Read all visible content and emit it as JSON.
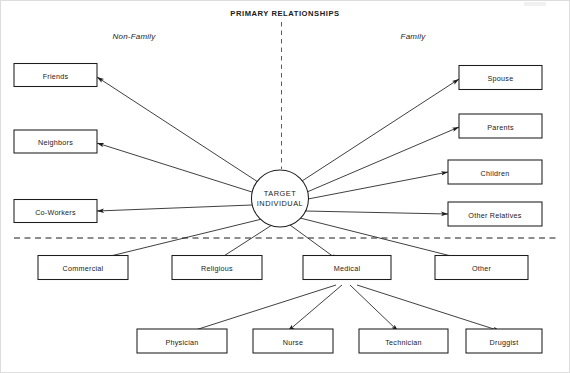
{
  "diagram": {
    "title": "PRIMARY RELATIONSHIPS",
    "sections": {
      "left_label": "Non-Family",
      "right_label": "Family"
    },
    "center_node": {
      "line1": "TARGET",
      "line2": "INDIVIDUAL"
    },
    "non_family_primary": [
      {
        "label": "Friends"
      },
      {
        "label": "Neighbors"
      },
      {
        "label": "Co-Workers"
      }
    ],
    "family_primary": [
      {
        "label": "Spouse"
      },
      {
        "label": "Parents"
      },
      {
        "label": "Children"
      },
      {
        "label": "Other Relatives"
      }
    ],
    "secondary": [
      {
        "label": "Commercial"
      },
      {
        "label": "Religious"
      },
      {
        "label": "Medical"
      },
      {
        "label": "Other"
      }
    ],
    "medical_children": [
      {
        "label": "Physician"
      },
      {
        "label": "Nurse"
      },
      {
        "label": "Technician"
      },
      {
        "label": "Druggist"
      }
    ],
    "colors": {
      "line": "#1d1d1d",
      "text": "#1a1a1a",
      "background": "#ffffff"
    }
  }
}
